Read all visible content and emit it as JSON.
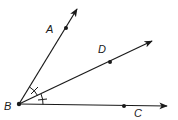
{
  "figure": {
    "stroke_color": "#1a1a1a",
    "background": "#ffffff",
    "vertex": {
      "label": "B",
      "x": 19,
      "y": 104,
      "label_x": 4,
      "label_y": 110
    },
    "rays": [
      {
        "name": "ray-BA",
        "end_x": 77,
        "end_y": 9,
        "point": {
          "label": "A",
          "x": 66,
          "y": 28,
          "label_x": 46,
          "label_y": 33
        }
      },
      {
        "name": "ray-BD",
        "end_x": 152,
        "end_y": 41,
        "point": {
          "label": "D",
          "x": 110,
          "y": 62,
          "label_x": 98,
          "label_y": 53
        }
      },
      {
        "name": "ray-BC",
        "end_x": 167,
        "end_y": 106,
        "point": {
          "label": "C",
          "x": 124,
          "y": 106,
          "label_x": 134,
          "label_y": 117
        }
      }
    ],
    "angle_marks": {
      "congruent": [
        "ABD",
        "DBC"
      ],
      "tick_count_each": 1
    }
  }
}
